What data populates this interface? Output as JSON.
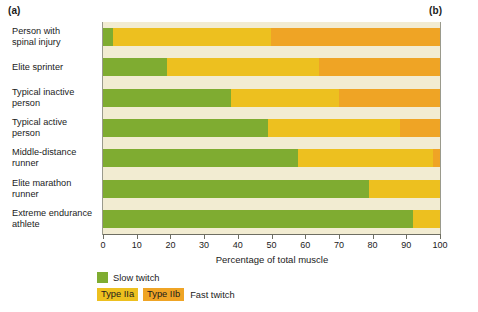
{
  "panels": {
    "a_label": "(a)",
    "b_label": "(b)"
  },
  "chart_data": {
    "type": "bar",
    "orientation": "horizontal",
    "stacked": true,
    "title": "",
    "xlabel": "Percentage of total muscle",
    "ylabel": "",
    "xlim": [
      0,
      100
    ],
    "xticks": [
      0,
      10,
      20,
      30,
      40,
      50,
      60,
      70,
      80,
      90,
      100
    ],
    "xticklabels": [
      "0",
      "10",
      "20",
      "30",
      "40",
      "50",
      "60",
      "70",
      "80",
      "90",
      "100"
    ],
    "grid": false,
    "legend_position": "below-left",
    "categories": [
      "Person with\nspinal injury",
      "Elite sprinter",
      "Typical inactive\nperson",
      "Typical active\nperson",
      "Middle-distance\nrunner",
      "Elite marathon\nrunner",
      "Extreme endurance\nathlete"
    ],
    "series": [
      {
        "name": "Slow twitch",
        "color": "#7fac31",
        "values": [
          3,
          19,
          38,
          49,
          58,
          79,
          92
        ]
      },
      {
        "name": "Type IIa",
        "color": "#edc01f",
        "values": [
          47,
          45,
          32,
          39,
          40,
          21,
          8
        ]
      },
      {
        "name": "Type IIb",
        "color": "#efa425",
        "values": [
          50,
          36,
          30,
          12,
          2,
          0,
          0
        ]
      }
    ],
    "plot_background": "#f2ecd2"
  },
  "legend": {
    "slow_label": "Slow twitch",
    "type_iia_label": "Type IIa",
    "type_iib_label": "Type IIb",
    "fast_label": "Fast twitch"
  }
}
